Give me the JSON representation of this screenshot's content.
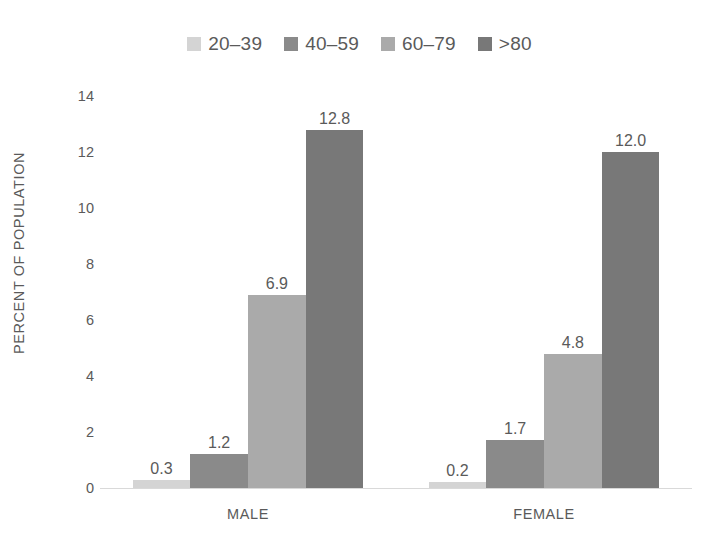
{
  "chart_data": {
    "type": "bar",
    "title": "",
    "subtitle": "",
    "xlabel": "",
    "ylabel": "PERCENT OF POPULATION",
    "categories": [
      "MALE",
      "FEMALE"
    ],
    "series": [
      {
        "name": "20–39",
        "color": "#d4d4d4",
        "values": [
          0.3,
          0.2
        ],
        "labels": [
          "0.3",
          "0.2"
        ]
      },
      {
        "name": "40–59",
        "color": "#8a8a8a",
        "values": [
          1.2,
          1.7
        ],
        "labels": [
          "1.2",
          "1.7"
        ]
      },
      {
        "name": "60–79",
        "color": "#aaaaaa",
        "values": [
          6.9,
          4.8
        ],
        "labels": [
          "6.9",
          "4.8"
        ]
      },
      {
        "name": ">80",
        "color": "#787878",
        "values": [
          12.8,
          12.0
        ],
        "labels": [
          "12.8",
          "12.0"
        ]
      }
    ],
    "ylim": [
      0,
      14
    ],
    "yticks": [
      0,
      2,
      4,
      6,
      8,
      10,
      12,
      14
    ],
    "ytick_labels": [
      "0",
      "2",
      "4",
      "6",
      "8",
      "10",
      "12",
      "14"
    ],
    "grid": false,
    "legend_position": "top-center",
    "data_labels_shown": true,
    "background_color": "#ffffff",
    "text_color": "#5a5a5a",
    "axis_line_color": "#d9d9d9"
  },
  "legend": {
    "items": [
      {
        "label": "20–39",
        "color": "#d4d4d4"
      },
      {
        "label": "40–59",
        "color": "#8a8a8a"
      },
      {
        "label": "60–79",
        "color": "#aaaaaa"
      },
      {
        "label": ">80",
        "color": "#787878"
      }
    ]
  },
  "axes": {
    "y_title": "PERCENT OF POPULATION",
    "y_tick_labels": [
      "14",
      "12",
      "10",
      "8",
      "6",
      "4",
      "2",
      "0"
    ],
    "x_tick_labels": [
      "MALE",
      "FEMALE"
    ]
  },
  "bar_labels": {
    "male": [
      "0.3",
      "1.2",
      "6.9",
      "12.8"
    ],
    "female": [
      "0.2",
      "1.7",
      "4.8",
      "12.0"
    ]
  }
}
